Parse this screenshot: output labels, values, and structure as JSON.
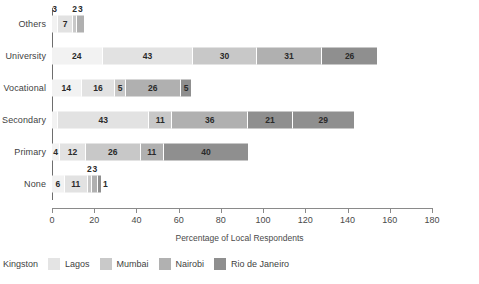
{
  "chart_data": {
    "type": "bar",
    "orientation": "horizontal",
    "stacked": true,
    "title": "",
    "xlabel": "Percentage of Local Respondents",
    "ylabel": "",
    "xlim": [
      0,
      180
    ],
    "xticks": [
      0,
      20,
      40,
      60,
      80,
      100,
      120,
      140,
      160,
      180
    ],
    "grid": false,
    "legend_position": "bottom-left",
    "categories": [
      "Others",
      "University",
      "Vocational",
      "Secondary",
      "Primary",
      "None"
    ],
    "series": [
      {
        "name": "Kingston",
        "color": "#f2f2f2",
        "values": [
          3,
          24,
          14,
          3,
          4,
          6
        ]
      },
      {
        "name": "Lagos",
        "color": "#e2e2e2",
        "values": [
          7,
          43,
          16,
          43,
          12,
          11
        ]
      },
      {
        "name": "Mumbai",
        "color": "#c8c8c8",
        "values": [
          2,
          30,
          5,
          11,
          26,
          2
        ]
      },
      {
        "name": "Nairobi",
        "color": "#b0b0b0",
        "values": [
          3,
          31,
          26,
          36,
          11,
          3
        ]
      },
      {
        "name": "Rio de Janeiro",
        "color": "#8f8f8f",
        "values": [
          0,
          26,
          5,
          21,
          40,
          1
        ]
      }
    ]
  },
  "rows": [
    {
      "label": "Others",
      "segments": [
        {
          "series": "Kingston",
          "value": 3,
          "label": "3",
          "label_pos": "top"
        },
        {
          "series": "Lagos",
          "value": 7,
          "label": "7",
          "label_pos": "in"
        },
        {
          "series": "Mumbai",
          "value": 2,
          "label": "2",
          "label_pos": "top"
        },
        {
          "series": "Nairobi",
          "value": 3,
          "label": "3",
          "label_pos": "top"
        }
      ]
    },
    {
      "label": "University",
      "segments": [
        {
          "series": "Kingston",
          "value": 24,
          "label": "24",
          "label_pos": "in"
        },
        {
          "series": "Lagos",
          "value": 43,
          "label": "43",
          "label_pos": "in"
        },
        {
          "series": "Mumbai",
          "value": 30,
          "label": "30",
          "label_pos": "in"
        },
        {
          "series": "Nairobi",
          "value": 31,
          "label": "31",
          "label_pos": "in"
        },
        {
          "series": "Rio de Janeiro",
          "value": 26,
          "label": "26",
          "label_pos": "in"
        }
      ]
    },
    {
      "label": "Vocational",
      "segments": [
        {
          "series": "Kingston",
          "value": 14,
          "label": "14",
          "label_pos": "in"
        },
        {
          "series": "Lagos",
          "value": 16,
          "label": "16",
          "label_pos": "in"
        },
        {
          "series": "Mumbai",
          "value": 5,
          "label": "5",
          "label_pos": "in"
        },
        {
          "series": "Nairobi",
          "value": 26,
          "label": "26",
          "label_pos": "in"
        },
        {
          "series": "Rio de Janeiro",
          "value": 5,
          "label": "5",
          "label_pos": "in"
        }
      ]
    },
    {
      "label": "Secondary",
      "segments": [
        {
          "series": "Kingston",
          "value": 3,
          "label": "",
          "label_pos": "none"
        },
        {
          "series": "Lagos",
          "value": 43,
          "label": "43",
          "label_pos": "in"
        },
        {
          "series": "Mumbai",
          "value": 11,
          "label": "11",
          "label_pos": "in"
        },
        {
          "series": "Nairobi",
          "value": 36,
          "label": "36",
          "label_pos": "in"
        },
        {
          "series": "Rio de Janeiro",
          "value": 21,
          "label": "21",
          "label_pos": "in"
        },
        {
          "series": "Rio de Janeiro",
          "value": 29,
          "label": "29",
          "label_pos": "in"
        }
      ]
    },
    {
      "label": "Primary",
      "segments": [
        {
          "series": "Kingston",
          "value": 4,
          "label": "4",
          "label_pos": "in"
        },
        {
          "series": "Lagos",
          "value": 12,
          "label": "12",
          "label_pos": "in"
        },
        {
          "series": "Mumbai",
          "value": 26,
          "label": "26",
          "label_pos": "in"
        },
        {
          "series": "Nairobi",
          "value": 11,
          "label": "11",
          "label_pos": "in"
        },
        {
          "series": "Rio de Janeiro",
          "value": 40,
          "label": "40",
          "label_pos": "in"
        }
      ]
    },
    {
      "label": "None",
      "segments": [
        {
          "series": "Kingston",
          "value": 6,
          "label": "6",
          "label_pos": "in"
        },
        {
          "series": "Lagos",
          "value": 11,
          "label": "11",
          "label_pos": "in"
        },
        {
          "series": "Mumbai",
          "value": 2,
          "label": "2",
          "label_pos": "top"
        },
        {
          "series": "Nairobi",
          "value": 3,
          "label": "3",
          "label_pos": "top"
        },
        {
          "series": "Rio de Janeiro",
          "value": 1,
          "label": "1",
          "label_pos": "right"
        }
      ]
    }
  ],
  "axis": {
    "x_title": "Percentage of Local Respondents",
    "ticks": [
      "0",
      "20",
      "40",
      "60",
      "80",
      "100",
      "120",
      "140",
      "160",
      "180"
    ]
  },
  "legend": [
    {
      "label": "Kingston",
      "color": "#f2f2f2"
    },
    {
      "label": "Lagos",
      "color": "#e4e4e4"
    },
    {
      "label": "Mumbai",
      "color": "#c9c9c9"
    },
    {
      "label": "Nairobi",
      "color": "#b1b1b1"
    },
    {
      "label": "Rio de Janeiro",
      "color": "#8f8f8f"
    }
  ]
}
